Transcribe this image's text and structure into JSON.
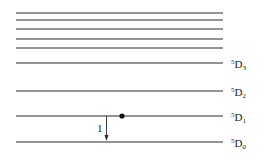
{
  "diagram": {
    "type": "energy-level-diagram",
    "upper_levels_unlabeled_y": [
      13,
      20,
      29,
      39,
      48
    ],
    "levels": [
      {
        "y": 63,
        "term": "5",
        "letter": "D",
        "j": "3"
      },
      {
        "y": 91,
        "term": "5",
        "letter": "D",
        "j": "2"
      },
      {
        "y": 116,
        "term": "5",
        "letter": "D",
        "j": "1"
      },
      {
        "y": 142,
        "term": "5",
        "letter": "D",
        "j": "0"
      }
    ],
    "transition": {
      "label": "1",
      "from": "5D1",
      "to": "5D0"
    },
    "electron_marker": {
      "level": "5D1"
    }
  }
}
